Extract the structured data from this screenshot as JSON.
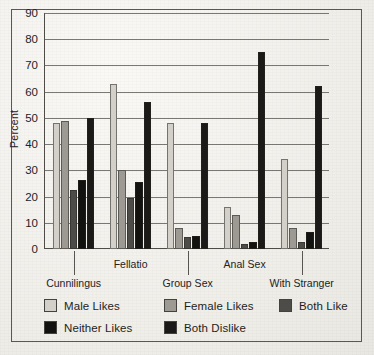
{
  "chart_data": {
    "type": "bar",
    "title": "",
    "xlabel": "",
    "ylabel": "Percent",
    "ylim": [
      0,
      90
    ],
    "yticks": [
      0,
      10,
      20,
      30,
      40,
      50,
      60,
      70,
      80,
      90
    ],
    "ytick_labels": [
      "0",
      "10",
      "20",
      "30",
      "40",
      "50",
      "60",
      "70",
      "80",
      "90"
    ],
    "grid": true,
    "legend_position": "below-axes",
    "categories": [
      "Cunnilingus",
      "Fellatio",
      "Group Sex",
      "Anal Sex",
      "With Stranger"
    ],
    "series": [
      {
        "name": "Male Likes",
        "color": "#d3d0c9",
        "values": [
          48,
          63,
          48,
          16,
          34.5
        ]
      },
      {
        "name": "Female Likes",
        "color": "#9c9a93",
        "values": [
          49,
          30,
          8,
          13,
          8
        ]
      },
      {
        "name": "Both Like",
        "color": "#4e4c48",
        "values": [
          22.5,
          19.5,
          4.5,
          2,
          2.5
        ]
      },
      {
        "name": "Neither Likes",
        "color": "#121210",
        "values": [
          26.5,
          25.5,
          5,
          2.5,
          6.5
        ]
      },
      {
        "name": "Both Dislike",
        "color": "#1b1a18",
        "values": [
          50,
          56,
          48,
          75,
          62
        ]
      }
    ]
  },
  "legend": {
    "entries": [
      {
        "label": "Male Likes",
        "color": "#d3d0c9"
      },
      {
        "label": "Female Likes",
        "color": "#9c9a93"
      },
      {
        "label": "Both Like",
        "color": "#4e4c48"
      },
      {
        "label": "Neither Likes",
        "color": "#121210"
      },
      {
        "label": "Both Dislike",
        "color": "#1b1a18"
      }
    ]
  },
  "axis": {
    "y_title": "Percent"
  }
}
